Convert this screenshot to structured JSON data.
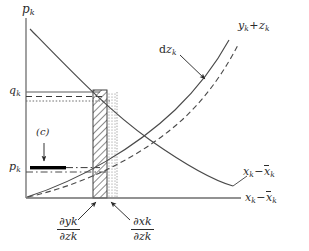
{
  "figure": {
    "title": "",
    "type": "economic-diagram",
    "background_color": "#ffffff",
    "ink_color": "#2b2b2b"
  },
  "axes": {
    "y_axis_label": "p",
    "y_axis_sub": "k",
    "x_axis_label_lead": "x",
    "x_axis_label_sub1": "k",
    "x_axis_label_minus": "−",
    "x_axis_label_bar": "x",
    "x_axis_label_sub2": "k",
    "origin_x": 26,
    "origin_y": 198
  },
  "ticks": {
    "upper": {
      "symbol": "q",
      "sub": "k",
      "y": 92
    },
    "lower": {
      "symbol": "p",
      "sub": "k",
      "y": 168
    }
  },
  "curves": [
    {
      "id": "demand-curve",
      "label_lead": "x",
      "label_sub1": "k",
      "label_minus": "−",
      "label_bar": "x",
      "label_sub2": "k",
      "style": "solid",
      "direction": "decreasing"
    },
    {
      "id": "supply-curve",
      "label_lead": "y",
      "label_sub1": "k",
      "label_plus": "+",
      "label_second": "z",
      "label_sub2": "k",
      "style": "solid",
      "direction": "increasing"
    },
    {
      "id": "shifted-supply-curve",
      "label_lead": "d",
      "label_second": "z",
      "label_sub": "k",
      "style": "dashed",
      "direction": "increasing"
    }
  ],
  "annotations": {
    "cost_marker": "(c)",
    "dz_arrow_label": "dz"
  },
  "derivatives": [
    {
      "id": "dy-dz",
      "num_op": "∂",
      "num_var": "y",
      "num_sub": "k",
      "den_op": "∂",
      "den_var": "z",
      "den_sub": "k"
    },
    {
      "id": "dx-dz",
      "num_op": "∂",
      "num_var": "x",
      "num_sub": "k",
      "den_op": "∂",
      "den_var": "z",
      "den_sub": "k"
    }
  ],
  "regions": {
    "hatched_bar": {
      "x_start": 93,
      "x_end": 107,
      "fill": "diagonal-hatch"
    },
    "dotted_bar": {
      "x_start": 107,
      "x_end": 117,
      "fill": "dotted"
    },
    "black_bar": {
      "x_start": 30,
      "x_end": 66,
      "y": 168,
      "fill": "#000000"
    }
  }
}
